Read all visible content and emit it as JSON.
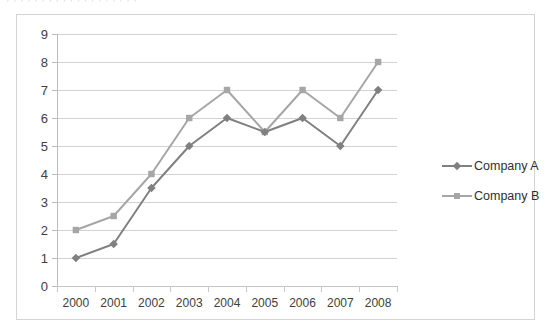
{
  "figure": {
    "ghost_text_top": "; ; ; ; ; ; ; ; ; ; ; ; ; ; ; ; ; ; ;",
    "background_color": "#ffffff",
    "border_color": "#d2d4d6"
  },
  "chart_data": {
    "type": "line",
    "title": "",
    "subtitle": "",
    "xlabel": "",
    "ylabel": "",
    "categories": [
      "2000",
      "2001",
      "2002",
      "2003",
      "2004",
      "2005",
      "2006",
      "2007",
      "2008"
    ],
    "series": [
      {
        "name": "Company A",
        "color": "#808080",
        "marker": "diamond",
        "values": [
          1,
          1.5,
          3.5,
          5,
          6,
          5.5,
          6,
          5,
          7
        ]
      },
      {
        "name": "Company B",
        "color": "#a6a6a6",
        "marker": "square",
        "values": [
          2,
          2.5,
          4,
          6,
          7,
          5.5,
          7,
          6,
          8
        ]
      }
    ],
    "ylim": [
      0,
      9
    ],
    "ytick_labels": [
      "0",
      "1",
      "2",
      "3",
      "4",
      "5",
      "6",
      "7",
      "8",
      "9"
    ],
    "ytick_values": [
      0,
      1,
      2,
      3,
      4,
      5,
      6,
      7,
      8,
      9
    ],
    "grid": true,
    "grid_color": "#d0d2d4",
    "legend_position": "right",
    "legend_entries": [
      "Company A",
      "Company B"
    ]
  }
}
